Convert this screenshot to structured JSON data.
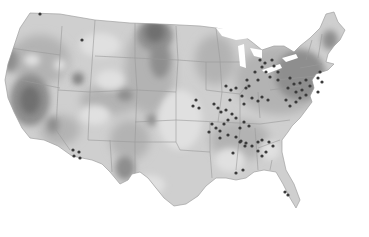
{
  "map": {
    "type": "choropleth-with-points",
    "region": "Contiguous United States",
    "colors": {
      "background": "#ffffff",
      "land_light": "#d4d4d4",
      "land_mid": "#b8b8b8",
      "land_dark": "#8f8f8f",
      "land_darkest": "#6e6e6e",
      "border": "#9a9a9a",
      "dot": "#3a3a3a"
    },
    "points": [
      [
        40,
        14
      ],
      [
        82,
        40
      ],
      [
        260,
        60
      ],
      [
        265,
        63
      ],
      [
        272,
        60
      ],
      [
        262,
        67
      ],
      [
        255,
        72
      ],
      [
        266,
        72
      ],
      [
        274,
        66
      ],
      [
        278,
        72
      ],
      [
        270,
        77
      ],
      [
        258,
        80
      ],
      [
        278,
        80
      ],
      [
        247,
        80
      ],
      [
        249,
        86
      ],
      [
        246,
        88
      ],
      [
        290,
        78
      ],
      [
        294,
        84
      ],
      [
        300,
        83
      ],
      [
        288,
        88
      ],
      [
        296,
        92
      ],
      [
        302,
        90
      ],
      [
        306,
        95
      ],
      [
        286,
        100
      ],
      [
        290,
        106
      ],
      [
        296,
        102
      ],
      [
        300,
        98
      ],
      [
        310,
        86
      ],
      [
        306,
        80
      ],
      [
        318,
        78
      ],
      [
        320,
        72
      ],
      [
        322,
        82
      ],
      [
        318,
        92
      ],
      [
        226,
        86
      ],
      [
        231,
        90
      ],
      [
        236,
        88
      ],
      [
        242,
        96
      ],
      [
        230,
        100
      ],
      [
        244,
        104
      ],
      [
        252,
        98
      ],
      [
        258,
        101
      ],
      [
        262,
        97
      ],
      [
        268,
        100
      ],
      [
        196,
        100
      ],
      [
        193,
        106
      ],
      [
        199,
        108
      ],
      [
        214,
        104
      ],
      [
        218,
        108
      ],
      [
        221,
        112
      ],
      [
        226,
        110
      ],
      [
        232,
        114
      ],
      [
        228,
        120
      ],
      [
        236,
        118
      ],
      [
        212,
        124
      ],
      [
        216,
        128
      ],
      [
        220,
        131
      ],
      [
        224,
        124
      ],
      [
        240,
        128
      ],
      [
        244,
        122
      ],
      [
        249,
        126
      ],
      [
        209,
        132
      ],
      [
        220,
        138
      ],
      [
        228,
        135
      ],
      [
        236,
        137
      ],
      [
        240,
        142
      ],
      [
        246,
        143
      ],
      [
        252,
        146
      ],
      [
        258,
        142
      ],
      [
        262,
        140
      ],
      [
        233,
        153
      ],
      [
        241,
        141
      ],
      [
        245,
        146
      ],
      [
        258,
        151
      ],
      [
        262,
        156
      ],
      [
        266,
        152
      ],
      [
        269,
        142
      ],
      [
        273,
        146
      ],
      [
        236,
        173
      ],
      [
        243,
        170
      ],
      [
        285,
        192
      ],
      [
        288,
        195
      ],
      [
        73,
        150
      ],
      [
        79,
        152
      ],
      [
        74,
        156
      ],
      [
        80,
        158
      ]
    ]
  },
  "chart_data": {
    "type": "map",
    "title": "",
    "legend": []
  }
}
